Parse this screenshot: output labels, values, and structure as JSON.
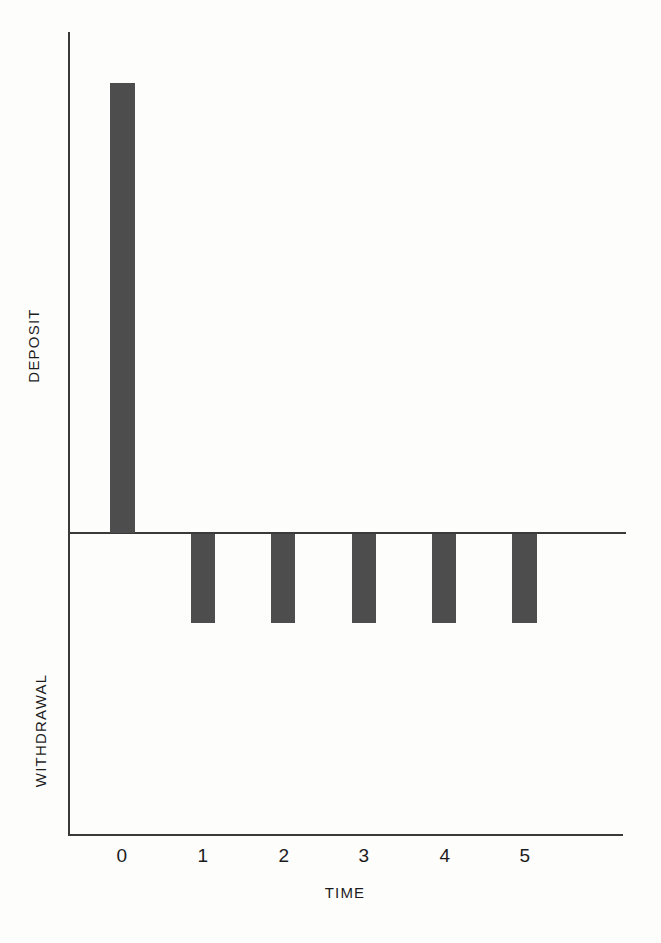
{
  "chart_data": {
    "type": "bar",
    "title": "",
    "subtitle": "",
    "xlabel": "TIME",
    "ylabel_positive": "DEPOSIT",
    "ylabel_negative": "WITHDRAWAL",
    "categories": [
      "0",
      "1",
      "2",
      "3",
      "4",
      "5"
    ],
    "values": [
      100,
      -19,
      -19,
      -19,
      -19,
      -19
    ],
    "series": [
      {
        "name": "Cash flow",
        "values": [
          100,
          -19,
          -19,
          -19,
          -19,
          -19
        ]
      }
    ],
    "ylim": [
      -72,
      112
    ],
    "grid": false,
    "legend": false,
    "legend_position": "none",
    "zero_line": true,
    "bar_color": "#4d4d4d",
    "axis_color": "#3a3a3a",
    "background_color": "#fdfdfc",
    "annotations": []
  },
  "axis": {
    "ticks": [
      {
        "label": "0",
        "x": 122
      },
      {
        "label": "1",
        "x": 203
      },
      {
        "label": "2",
        "x": 284
      },
      {
        "label": "3",
        "x": 364
      },
      {
        "label": "4",
        "x": 445
      },
      {
        "label": "5",
        "x": 525
      }
    ]
  },
  "bars": [
    {
      "name": "deposit-bar-0",
      "category": "0",
      "left": 110,
      "top": 83,
      "width": 25,
      "height": 450
    },
    {
      "name": "withdrawal-bar-1",
      "category": "1",
      "left": 191,
      "top": 534,
      "width": 24,
      "height": 89
    },
    {
      "name": "withdrawal-bar-2",
      "category": "2",
      "left": 271,
      "top": 534,
      "width": 24,
      "height": 89
    },
    {
      "name": "withdrawal-bar-3",
      "category": "3",
      "left": 352,
      "top": 534,
      "width": 24,
      "height": 89
    },
    {
      "name": "withdrawal-bar-4",
      "category": "4",
      "left": 432,
      "top": 534,
      "width": 24,
      "height": 89
    },
    {
      "name": "withdrawal-bar-5",
      "category": "5",
      "left": 512,
      "top": 534,
      "width": 25,
      "height": 89
    }
  ]
}
